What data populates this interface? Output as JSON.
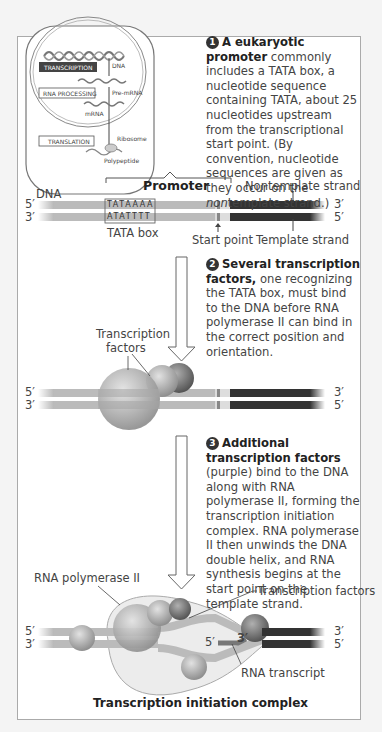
{
  "cell_overview": {
    "boxes": {
      "transcription": "TRANSCRIPTION",
      "rna_processing": "RNA PROCESSING",
      "translation": "TRANSLATION"
    },
    "labels": {
      "dna": "DNA",
      "pre_mrna": "Pre-mRNA",
      "mrna": "mRNA",
      "ribosome": "Ribosome",
      "polypeptide": "Polypeptide"
    }
  },
  "step1": {
    "number": "1",
    "bold": "A eukaryotic promoter",
    "text_a": " commonly includes a TATA box, a nucleotide sequence containing TATA, about 25 nucleotides upstream from the transcriptional start point. (By convention, nucleotide sequences are given as they occur on the ",
    "italic": "non",
    "text_b": "template strand.)"
  },
  "panel1": {
    "promoter_label": "Promoter",
    "dna_label": "DNA",
    "nontemplate_label": "Nontemplate strand",
    "template_label": "Template strand",
    "tata_box_label": "TATA box",
    "start_point_label": "Start point",
    "top_seq": "TATAAAA",
    "bottom_seq": "ATATTTT",
    "ends": {
      "top_left": "5′",
      "top_right": "3′",
      "bottom_left": "3′",
      "bottom_right": "5′"
    }
  },
  "step2": {
    "number": "2",
    "bold": "Several transcription factors,",
    "text": " one recognizing the TATA box, must bind to the DNA before RNA polymerase II can bind in the correct position and orientation."
  },
  "panel2": {
    "tf_label_1": "Transcription",
    "tf_label_2": "factors",
    "ends": {
      "top_left": "5′",
      "top_right": "3′",
      "bottom_left": "3′",
      "bottom_right": "5′"
    }
  },
  "step3": {
    "number": "3",
    "bold": "Additional transcription factors",
    "text": " (purple) bind to the DNA along with RNA polymerase II, forming the transcription initiation complex. RNA polymerase II then unwinds the DNA double helix, and RNA synthesis begins at the start point on the template strand."
  },
  "panel3": {
    "rna_pol_label": "RNA polymerase II",
    "tf_label": "Transcription factors",
    "rna_transcript_label": "RNA transcript",
    "rna_5": "5′",
    "rna_3": "3′",
    "caption": "Transcription initiation complex",
    "ends": {
      "top_left": "5′",
      "top_right": "3′",
      "bottom_left": "3′",
      "bottom_right": "5′"
    }
  },
  "colors": {
    "dark_strand": "#3a3a3a",
    "light_strand": "#b8b8b8",
    "frame": "#aaaaaa"
  }
}
